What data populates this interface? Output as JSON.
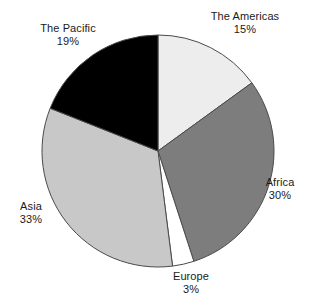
{
  "chart_data": {
    "type": "pie",
    "title": "",
    "xlabel": "",
    "ylabel": "",
    "legend_position": "none",
    "grid": false,
    "start_angle_deg": 0,
    "direction": "clockwise",
    "units": "percent",
    "categories": [
      "The Americas",
      "Africa",
      "Europe",
      "Asia",
      "The Pacific"
    ],
    "values": [
      15,
      30,
      3,
      33,
      19
    ],
    "slices": [
      {
        "label": "The Americas",
        "value": 15,
        "value_label": "15%",
        "color": "#ededed"
      },
      {
        "label": "Africa",
        "value": 30,
        "value_label": "30%",
        "color": "#7d7d7d"
      },
      {
        "label": "Europe",
        "value": 3,
        "value_label": "3%",
        "color": "#ffffff"
      },
      {
        "label": "Asia",
        "value": 33,
        "value_label": "33%",
        "color": "#c8c8c8"
      },
      {
        "label": "The Pacific",
        "value": 19,
        "value_label": "19%",
        "color": "#000000"
      }
    ]
  },
  "labels": {
    "americas": {
      "name": "The Americas",
      "value": "15%"
    },
    "africa": {
      "name": "Africa",
      "value": "30%"
    },
    "europe": {
      "name": "Europe",
      "value": "3%"
    },
    "asia": {
      "name": "Asia",
      "value": "33%"
    },
    "pacific": {
      "name": "The Pacific",
      "value": "19%"
    }
  },
  "colors": {
    "americas": "#ededed",
    "africa": "#7d7d7d",
    "europe": "#ffffff",
    "asia": "#c8c8c8",
    "pacific": "#000000",
    "outline": "#4a4a4a",
    "background": "#ffffff",
    "text": "#1a1a1a"
  }
}
